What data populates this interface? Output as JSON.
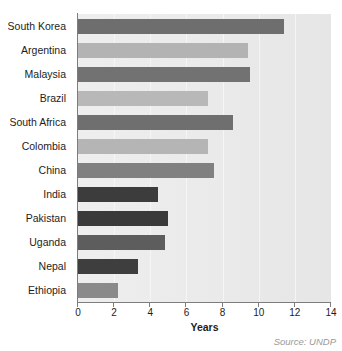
{
  "chart_data": {
    "type": "bar",
    "orientation": "horizontal",
    "title": "",
    "subtitle": "",
    "xlabel": "Years",
    "ylabel": "",
    "xlim": [
      0,
      14
    ],
    "xticks": [
      0,
      2,
      4,
      6,
      8,
      10,
      12,
      14
    ],
    "xtick_labels": [
      "0",
      "2",
      "4",
      "6",
      "8",
      "10",
      "12",
      "14"
    ],
    "grid": true,
    "grid_axis": "x",
    "legend": false,
    "legend_position": "none",
    "annotations": [
      "Source: UNDP"
    ],
    "source_note": "Source: UNDP",
    "categories": [
      "South Korea",
      "Argentina",
      "Malaysia",
      "Brazil",
      "South Africa",
      "Colombia",
      "China",
      "India",
      "Pakistan",
      "Uganda",
      "Nepal",
      "Ethiopia"
    ],
    "values": [
      11.4,
      9.4,
      9.5,
      7.2,
      8.6,
      7.2,
      7.5,
      4.4,
      5.0,
      4.8,
      3.3,
      2.2
    ],
    "bar_colors": [
      "#6e6e6e",
      "#b3b3b3",
      "#727272",
      "#b8b8b8",
      "#6f6f6f",
      "#b5b5b5",
      "#808080",
      "#3c3c3c",
      "#3a3a3a",
      "#5d5d5d",
      "#3e3e3e",
      "#8a8a8a"
    ],
    "bars": [
      {
        "category": "South Korea",
        "value": 11.4,
        "color": "#6e6e6e"
      },
      {
        "category": "Argentina",
        "value": 9.4,
        "color": "#b3b3b3"
      },
      {
        "category": "Malaysia",
        "value": 9.5,
        "color": "#727272"
      },
      {
        "category": "Brazil",
        "value": 7.2,
        "color": "#b8b8b8"
      },
      {
        "category": "South Africa",
        "value": 8.6,
        "color": "#6f6f6f"
      },
      {
        "category": "Colombia",
        "value": 7.2,
        "color": "#b5b5b5"
      },
      {
        "category": "China",
        "value": 7.5,
        "color": "#808080"
      },
      {
        "category": "India",
        "value": 4.4,
        "color": "#3c3c3c"
      },
      {
        "category": "Pakistan",
        "value": 5.0,
        "color": "#3a3a3a"
      },
      {
        "category": "Uganda",
        "value": 4.8,
        "color": "#5d5d5d"
      },
      {
        "category": "Nepal",
        "value": 3.3,
        "color": "#3e3e3e"
      },
      {
        "category": "Ethiopia",
        "value": 2.2,
        "color": "#8a8a8a"
      }
    ],
    "plot_background": "#ebebeb",
    "axis_color": "#7d7d7d"
  }
}
